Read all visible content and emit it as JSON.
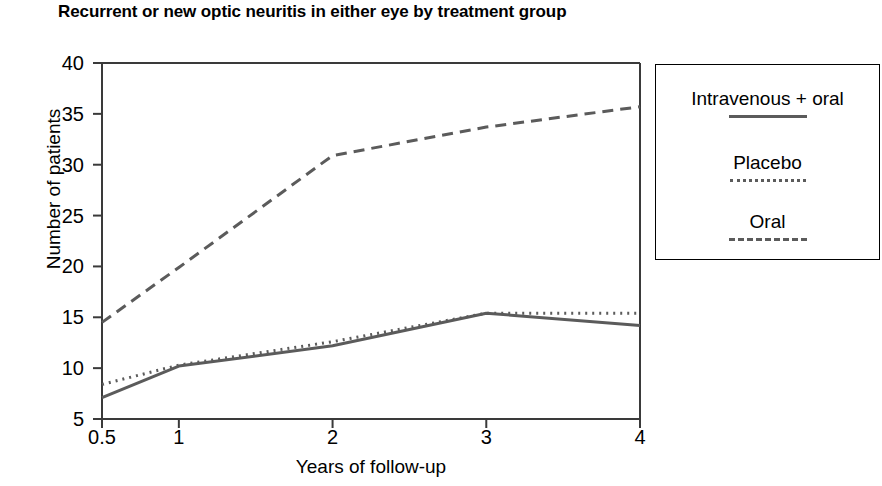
{
  "chart_data": {
    "type": "line",
    "title": "Recurrent or new optic neuritis in either eye by treatment group",
    "xlabel": "Years of follow-up",
    "ylabel": "Number of patients",
    "x": [
      0.5,
      1,
      2,
      3,
      4
    ],
    "xticklabels": [
      "0.5",
      "1",
      "2",
      "3",
      "4"
    ],
    "yticks": [
      5,
      10,
      15,
      20,
      25,
      30,
      35,
      40
    ],
    "yticklabels": [
      "5",
      "10",
      "15",
      "20",
      "25",
      "30",
      "35",
      "40"
    ],
    "ylim": [
      5,
      40
    ],
    "xlim": [
      0.5,
      4
    ],
    "grid": false,
    "legend_position": "right",
    "series": [
      {
        "name": "Intravenous + oral",
        "linestyle": "solid",
        "color": "#5b5b5b",
        "values": [
          7.1,
          10.2,
          12.2,
          15.4,
          14.2
        ]
      },
      {
        "name": "Placebo",
        "linestyle": "dotted",
        "color": "#5b5b5b",
        "values": [
          8.4,
          10.3,
          12.6,
          15.4,
          15.4
        ]
      },
      {
        "name": "Oral",
        "linestyle": "dashed",
        "color": "#5b5b5b",
        "values": [
          14.5,
          19.9,
          30.9,
          33.7,
          35.7
        ]
      }
    ]
  },
  "legend": {
    "entries": [
      {
        "label": "Intravenous + oral",
        "style": "solid"
      },
      {
        "label": "Placebo",
        "style": "dotted"
      },
      {
        "label": "Oral",
        "style": "dashed"
      }
    ]
  },
  "axis": {
    "color": "#3a3a3a"
  }
}
